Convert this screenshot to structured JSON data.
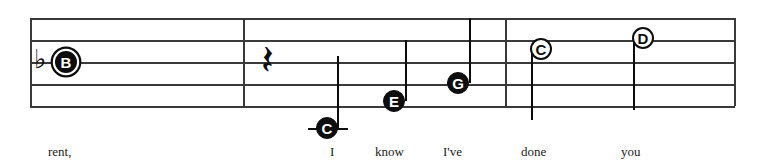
{
  "score": {
    "type": "music-notation-excerpt",
    "staff": {
      "left": 30,
      "right": 735,
      "line_ys": [
        18,
        40,
        62,
        84,
        106
      ],
      "line_spacing": 22,
      "color": "#3a3a3a"
    },
    "key_signature": {
      "accidental_glyph": "♭",
      "name": "flat",
      "x": 40,
      "y": 62
    },
    "barlines": [
      {
        "name": "barline-1",
        "x": 243
      },
      {
        "name": "barline-2",
        "x": 505
      },
      {
        "name": "barline-end",
        "x": 734
      }
    ],
    "rests": [
      {
        "name": "quarter-rest",
        "glyph": "𝄽",
        "label": "quarter rest",
        "x": 270,
        "y": 61
      }
    ],
    "notes": [
      {
        "label": "B",
        "name": "note-b",
        "style": "ringed",
        "x": 66,
        "y": 62,
        "radius": 11,
        "font_size": 15,
        "stem": "none",
        "ledger": false
      },
      {
        "label": "C",
        "name": "note-c-low",
        "style": "filled",
        "x": 327,
        "y": 128,
        "radius": 11,
        "font_size": 15,
        "stem": "up",
        "stem_x": 337,
        "stem_top": 56,
        "stem_bottom": 128,
        "ledger": true,
        "ledger_x": 308,
        "ledger_width": 40,
        "ledger_y": 128
      },
      {
        "label": "E",
        "name": "note-e",
        "style": "filled",
        "x": 394,
        "y": 101,
        "radius": 11,
        "font_size": 15,
        "stem": "up",
        "stem_x": 405,
        "stem_top": 40,
        "stem_bottom": 101,
        "ledger": false
      },
      {
        "label": "G",
        "name": "note-g",
        "style": "filled",
        "x": 458,
        "y": 83,
        "radius": 11,
        "font_size": 15,
        "stem": "up",
        "stem_x": 469,
        "stem_top": 18,
        "stem_bottom": 83,
        "ledger": false
      },
      {
        "label": "C",
        "name": "note-c-high",
        "style": "hollow",
        "x": 541,
        "y": 49,
        "radius": 11,
        "font_size": 15,
        "stem": "down",
        "stem_x": 531,
        "stem_top": 49,
        "stem_bottom": 120,
        "ledger": false
      },
      {
        "label": "D",
        "name": "note-d",
        "style": "hollow",
        "x": 643,
        "y": 38,
        "radius": 11,
        "font_size": 15,
        "stem": "down",
        "stem_x": 633,
        "stem_top": 38,
        "stem_bottom": 110,
        "ledger": false
      }
    ],
    "lyrics": [
      {
        "text": "rent,",
        "name": "lyric-rent",
        "x": 48,
        "y": 145
      },
      {
        "text": "I",
        "name": "lyric-i",
        "x": 330,
        "y": 145
      },
      {
        "text": "know",
        "name": "lyric-know",
        "x": 375,
        "y": 145
      },
      {
        "text": "I've",
        "name": "lyric-ive",
        "x": 443,
        "y": 145
      },
      {
        "text": "done",
        "name": "lyric-done",
        "x": 521,
        "y": 145
      },
      {
        "text": "you",
        "name": "lyric-you",
        "x": 621,
        "y": 145
      }
    ]
  }
}
